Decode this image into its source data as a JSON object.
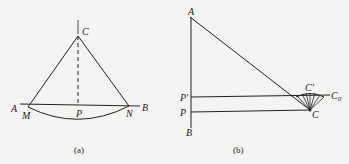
{
  "figure_a": {
    "caption": "(a)",
    "labels": {
      "C": "C",
      "A": "A",
      "M": "M",
      "P": "P",
      "N": "N",
      "B": "B"
    }
  },
  "figure_b": {
    "caption": "(b)",
    "labels": {
      "A": "A",
      "P_prime": "P'",
      "P": "P",
      "B": "B",
      "C_prime": "C'",
      "C0": "C",
      "C0_sub": "0",
      "C": "C"
    }
  },
  "colors": {
    "background": "#f4f4f2",
    "ink": "#222222"
  }
}
